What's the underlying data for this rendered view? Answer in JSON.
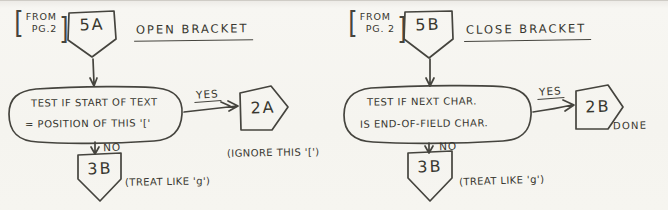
{
  "page": {
    "ink_color": "#45443e",
    "paper_color": "#f6f5f0"
  },
  "left": {
    "from_note": {
      "open": "[",
      "line1": "FROM",
      "line2": "PG.2",
      "close": "]"
    },
    "entry_connector": "5A",
    "title": "OPEN BRACKET",
    "test": {
      "line1": "TEST IF START OF TEXT",
      "line2": "= POSITION OF THIS '['"
    },
    "yes_label": "YES",
    "yes_connector": "2A",
    "yes_note": "(IGNORE THIS '[')",
    "no_label": "NO",
    "no_connector": "3B",
    "no_note": "(TREAT LIKE 'g')"
  },
  "right": {
    "from_note": {
      "open": "[",
      "line1": "FROM",
      "line2": "PG. 2",
      "close": "]"
    },
    "entry_connector": "5B",
    "title": "CLOSE BRACKET",
    "test": {
      "line1": "TEST IF NEXT CHAR.",
      "line2": "IS END-OF-FIELD CHAR."
    },
    "yes_label": "YES",
    "yes_connector": "2B",
    "yes_note": "DONE",
    "no_label": "NO",
    "no_connector": "3B",
    "no_note": "(TREAT LIKE 'g')"
  }
}
